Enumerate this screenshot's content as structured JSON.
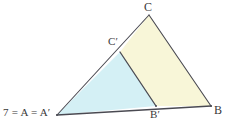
{
  "figure": {
    "background_color": "#ffffff",
    "stroke_color": "#4a4a52",
    "label_color": "#3a3a3a",
    "regions": {
      "inner_triangle": {
        "name": "triangle-A-Bprime-Cprime",
        "fill_color": "#d4f0f5"
      },
      "quadrilateral": {
        "name": "quadrilateral-Cprime-C-B-Bprime",
        "fill_color": "#f8f6d8"
      }
    },
    "labels": {
      "apex": "C",
      "inner_apex": "C′",
      "right": "B",
      "inner_right": "B′",
      "origin": "7 = A = A′"
    },
    "points": {
      "A": {
        "x": 57,
        "y": 115
      },
      "B": {
        "x": 211,
        "y": 106
      },
      "C": {
        "x": 149,
        "y": 15
      },
      "Cp": {
        "x": 120,
        "y": 52
      },
      "Bp": {
        "x": 156,
        "y": 106
      }
    }
  }
}
